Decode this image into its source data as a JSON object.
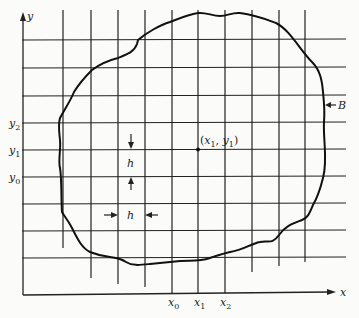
{
  "diagram": {
    "type": "finite-difference grid over irregular region",
    "axes": {
      "x_label": "x",
      "y_label": "y"
    },
    "x_ticks": [
      {
        "base": "x",
        "sub": "0"
      },
      {
        "base": "x",
        "sub": "1"
      },
      {
        "base": "x",
        "sub": "2"
      }
    ],
    "y_ticks": [
      {
        "base": "y",
        "sub": "2"
      },
      {
        "base": "y",
        "sub": "1"
      },
      {
        "base": "y",
        "sub": "0"
      }
    ],
    "point_label": {
      "open": "(",
      "x": "x",
      "xsub": "1",
      "comma": ", ",
      "y": "y",
      "ysub": "1",
      "close": ")"
    },
    "spacing_label_vertical": "h",
    "spacing_label_horizontal": "h",
    "boundary_label": "B",
    "colors": {
      "ink": "#222222",
      "paper": "#fbfbf9"
    }
  }
}
